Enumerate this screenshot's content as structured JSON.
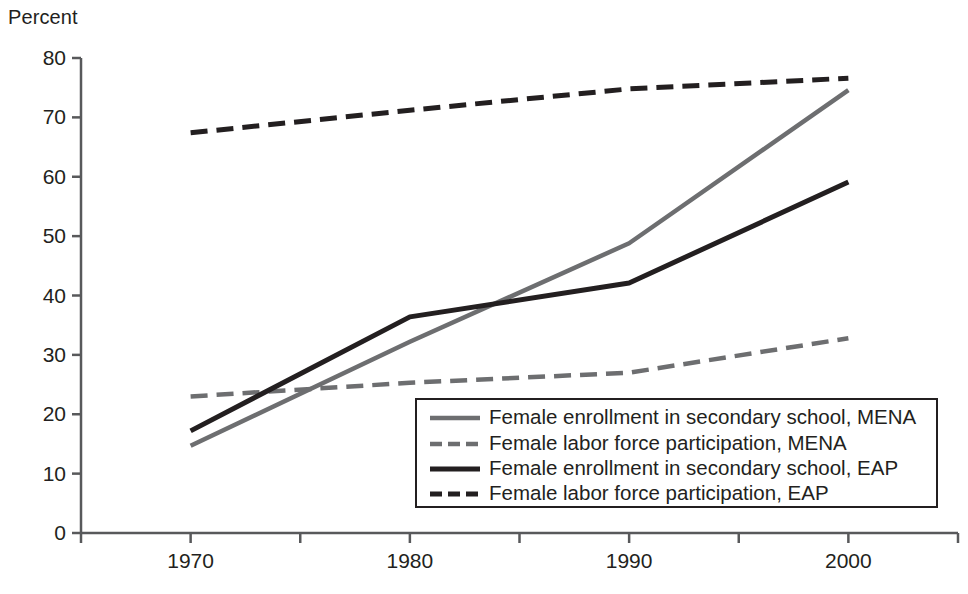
{
  "chart_data": {
    "type": "line",
    "title": "",
    "ylabel": "Percent",
    "xlabel": "",
    "x": [
      1970,
      1980,
      1990,
      2000
    ],
    "xticklabels": [
      "1970",
      "1980",
      "1990",
      "2000"
    ],
    "yticklabels": [
      "0",
      "10",
      "20",
      "30",
      "40",
      "50",
      "60",
      "70",
      "80"
    ],
    "yticks": [
      0,
      10,
      20,
      30,
      40,
      50,
      60,
      70,
      80
    ],
    "ylim": [
      0,
      80
    ],
    "xlim": [
      1965,
      2005
    ],
    "grid": false,
    "legend_position": "lower right",
    "series": [
      {
        "name": "Female enrollment in secondary school, MENA",
        "style": "solid",
        "color": "#6d6e70",
        "values": [
          14.7,
          32.2,
          48.8,
          74.6
        ]
      },
      {
        "name": "Female labor force participation, MENA",
        "style": "dashed",
        "color": "#6d6e70",
        "values": [
          23.0,
          25.3,
          27.0,
          32.8
        ]
      },
      {
        "name": "Female enrollment in secondary school, EAP",
        "style": "solid",
        "color": "#231f20",
        "values": [
          17.2,
          36.4,
          42.1,
          59.1
        ]
      },
      {
        "name": "Female labor force participation, EAP",
        "style": "dashed",
        "color": "#231f20",
        "values": [
          67.4,
          71.2,
          74.8,
          76.6
        ]
      }
    ]
  },
  "axes": {
    "y_axis_label": "Percent",
    "y_tick_0": "0",
    "y_tick_10": "10",
    "y_tick_20": "20",
    "y_tick_30": "30",
    "y_tick_40": "40",
    "y_tick_50": "50",
    "y_tick_60": "60",
    "y_tick_70": "70",
    "y_tick_80": "80",
    "x_tick_1970": "1970",
    "x_tick_1980": "1980",
    "x_tick_1990": "1990",
    "x_tick_2000": "2000"
  },
  "legend": {
    "items": [
      {
        "label": "Female enrollment in secondary school, MENA"
      },
      {
        "label": "Female labor force participation, MENA"
      },
      {
        "label": "Female enrollment in secondary school, EAP"
      },
      {
        "label": "Female labor force participation, EAP"
      }
    ]
  },
  "colors": {
    "ink": "#231f20",
    "gray_series": "#6d6e70",
    "background": "#ffffff"
  }
}
